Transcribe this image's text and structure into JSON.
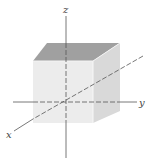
{
  "figure": {
    "axes": [
      {
        "name": "x",
        "label": "x"
      },
      {
        "name": "y",
        "label": "y"
      },
      {
        "name": "z",
        "label": "z"
      }
    ],
    "colors": {
      "front_face": "#ebebeb",
      "top_face": "#9c9c9c",
      "side_face": "#d6d6d6",
      "axis": "#555555"
    }
  }
}
